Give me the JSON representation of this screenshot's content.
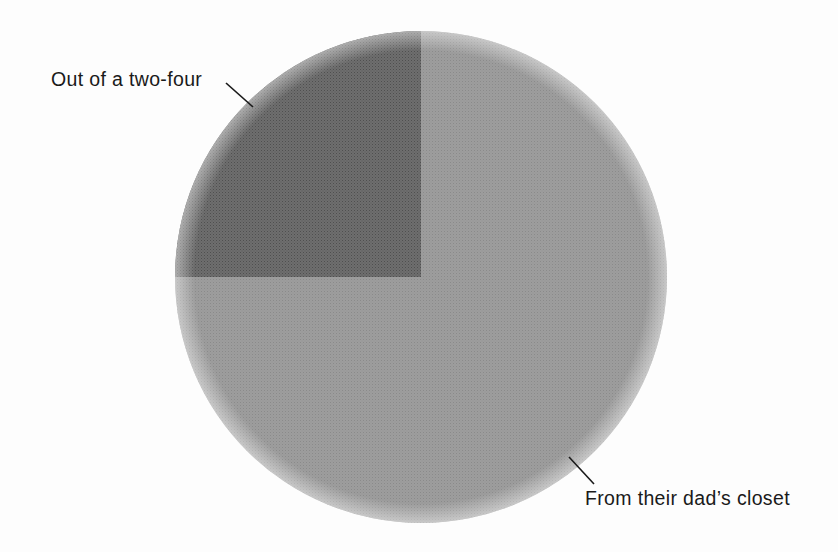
{
  "chart_data": {
    "type": "pie",
    "title": "",
    "subtitle": "",
    "xlabel": "",
    "ylabel": "",
    "grid": false,
    "legend_position": "none",
    "label_style": "leader-line callouts",
    "slices": [
      {
        "label": "Out of a two-four",
        "value": 25,
        "percent": "25%",
        "color": "#6b6b6b",
        "start_angle_deg": 270,
        "end_angle_deg": 180,
        "direction": "counterclockwise",
        "quadrant": "upper-left"
      },
      {
        "label": "From their dad’s closet",
        "value": 75,
        "percent": "75%",
        "color": "#9a9a9a",
        "start_angle_deg": 270,
        "end_angle_deg": 180,
        "direction": "clockwise",
        "quadrant": "upper-right, lower-right, lower-left"
      }
    ],
    "categories": [
      "Out of a two-four",
      "From their dad’s closet"
    ],
    "values": [
      25,
      75
    ],
    "total": 100
  },
  "figure": {
    "background_color": "#fdfdfd",
    "center_x": 421,
    "center_y": 277,
    "radius": 246
  },
  "labels": {
    "dark_slice": {
      "text": "Out of a two-four",
      "text_color": "#1a1a1a"
    },
    "light_slice": {
      "text": "From their dad’s closet",
      "text_color": "#1a1a1a"
    }
  },
  "leader_lines": {
    "color": "#1a1a1a",
    "dark_slice": {
      "x1": 226,
      "y1": 83,
      "x2": 253,
      "y2": 107
    },
    "light_slice": {
      "x1": 569,
      "y1": 457,
      "x2": 594,
      "y2": 484
    }
  }
}
